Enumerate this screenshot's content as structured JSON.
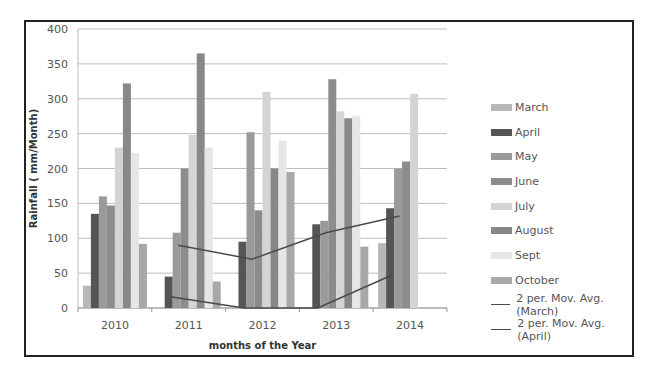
{
  "chart_data": {
    "type": "bar",
    "title": "",
    "xlabel": "months of the Year",
    "ylabel": "Rainfall ( mm/Month)",
    "ylim": [
      0,
      400
    ],
    "yticks": [
      0,
      50,
      100,
      150,
      200,
      250,
      300,
      350,
      400
    ],
    "grid": true,
    "legend_position": "right",
    "categories": [
      "2010",
      "2011",
      "2012",
      "2013",
      "2014"
    ],
    "series": [
      {
        "name": "March",
        "color": "#b8b8b8",
        "values": [
          32,
          0,
          0,
          0,
          93
        ]
      },
      {
        "name": "April",
        "color": "#555555",
        "values": [
          135,
          45,
          95,
          120,
          143
        ]
      },
      {
        "name": "May",
        "color": "#9a9a9a",
        "values": [
          160,
          108,
          252,
          125,
          200
        ]
      },
      {
        "name": "June",
        "color": "#8c8c8c",
        "values": [
          147,
          200,
          140,
          328,
          210
        ]
      },
      {
        "name": "July",
        "color": "#d4d4d4",
        "values": [
          230,
          248,
          310,
          282,
          307
        ]
      },
      {
        "name": "August",
        "color": "#888888",
        "values": [
          322,
          365,
          200,
          272,
          0
        ]
      },
      {
        "name": "Sept",
        "color": "#e6e6e6",
        "values": [
          222,
          230,
          240,
          275,
          0
        ]
      },
      {
        "name": "October",
        "color": "#a8a8a8",
        "values": [
          92,
          38,
          195,
          88,
          0
        ]
      }
    ],
    "trendlines": [
      {
        "name": "2 per. Mov. Avg. (March)",
        "color": "#4a4a4a",
        "values": [
          null,
          16,
          0,
          0,
          47
        ]
      },
      {
        "name": "2 per. Mov. Avg. (April)",
        "color": "#4a4a4a",
        "values": [
          null,
          90,
          70,
          108,
          132
        ]
      }
    ]
  },
  "legend": {
    "items": [
      "March",
      "April",
      "May",
      "June",
      "July",
      "August",
      "Sept",
      "October",
      "2 per. Mov. Avg. (March)",
      "2 per. Mov. Avg. (April)"
    ]
  }
}
